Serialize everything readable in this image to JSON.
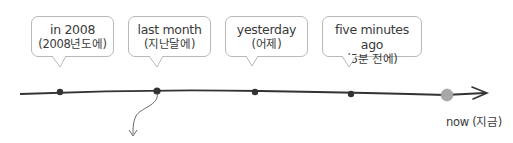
{
  "events": [
    {
      "en": "in 2008",
      "ko": "(2008년도에)"
    },
    {
      "en": "last month",
      "ko": "(지난달에)"
    },
    {
      "en": "yesterday",
      "ko": "(어제)"
    },
    {
      "en": "five minutes ago",
      "ko": "(5분 전에)"
    }
  ],
  "now_label": "now (지금)",
  "colors": {
    "line": "#333333",
    "now_dot": "#a8a8a8",
    "bubble_border": "#b8b8b8"
  }
}
